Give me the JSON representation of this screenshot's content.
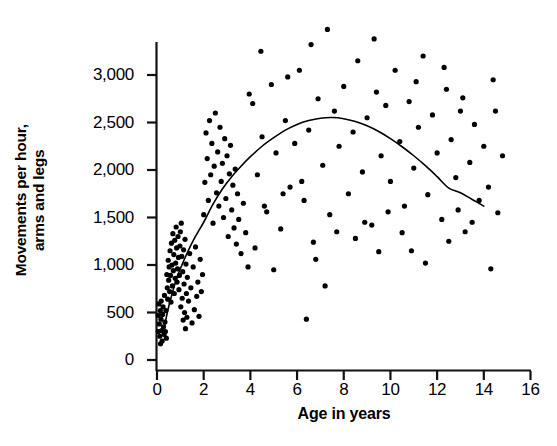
{
  "chart_data": {
    "type": "scatter",
    "title": "",
    "xlabel": "Age in years",
    "ylabel": "Movements per hour, arms and legs",
    "ylabel_lines": [
      "Movements per hour,",
      "arms and legs"
    ],
    "xlim": [
      0,
      16
    ],
    "ylim": [
      0,
      3500
    ],
    "xticks": [
      0,
      2,
      4,
      6,
      8,
      10,
      12,
      14,
      16
    ],
    "xtick_labels": [
      "0",
      "2",
      "4",
      "6",
      "8",
      "10",
      "12",
      "14",
      "16"
    ],
    "yticks": [
      0,
      500,
      1000,
      1500,
      2000,
      2500,
      3000
    ],
    "ytick_labels": [
      "0",
      "500",
      "1,000",
      "1,500",
      "2,000",
      "2,500",
      "3,000"
    ],
    "grid": false,
    "legend": null,
    "marker_color": "#000000",
    "marker_size_px": 5.2,
    "curve_color": "#000000",
    "curve_width_px": 1.6,
    "curve_description": "Quadratic trend line rising steeply from infancy, peaking near age 7.5 at about 2550 movements per hour, then declining to about 1620 by age 14",
    "series": [
      {
        "name": "Movements per hour",
        "points": [
          [
            0.05,
            470
          ],
          [
            0.06,
            300
          ],
          [
            0.08,
            590
          ],
          [
            0.1,
            380
          ],
          [
            0.12,
            250
          ],
          [
            0.14,
            520
          ],
          [
            0.15,
            170
          ],
          [
            0.17,
            430
          ],
          [
            0.18,
            620
          ],
          [
            0.2,
            310
          ],
          [
            0.22,
            200
          ],
          [
            0.24,
            480
          ],
          [
            0.26,
            560
          ],
          [
            0.28,
            350
          ],
          [
            0.3,
            270
          ],
          [
            0.32,
            680
          ],
          [
            0.34,
            400
          ],
          [
            0.36,
            300
          ],
          [
            0.38,
            520
          ],
          [
            0.4,
            230
          ],
          [
            0.42,
            900
          ],
          [
            0.44,
            760
          ],
          [
            0.46,
            640
          ],
          [
            0.48,
            1050
          ],
          [
            0.5,
            840
          ],
          [
            0.52,
            980
          ],
          [
            0.54,
            720
          ],
          [
            0.56,
            1150
          ],
          [
            0.58,
            890
          ],
          [
            0.6,
            610
          ],
          [
            0.62,
            1230
          ],
          [
            0.64,
            1000
          ],
          [
            0.66,
            780
          ],
          [
            0.68,
            1330
          ],
          [
            0.7,
            940
          ],
          [
            0.72,
            1110
          ],
          [
            0.74,
            700
          ],
          [
            0.76,
            1260
          ],
          [
            0.78,
            860
          ],
          [
            0.8,
            1020
          ],
          [
            0.82,
            1400
          ],
          [
            0.84,
            1180
          ],
          [
            0.86,
            820
          ],
          [
            0.88,
            960
          ],
          [
            0.9,
            1300
          ],
          [
            0.92,
            1080
          ],
          [
            0.94,
            740
          ],
          [
            0.96,
            890
          ],
          [
            0.98,
            1200
          ],
          [
            1.0,
            1350
          ],
          [
            1.02,
            560
          ],
          [
            1.04,
            1440
          ],
          [
            1.06,
            1090
          ],
          [
            1.08,
            650
          ],
          [
            1.1,
            930
          ],
          [
            1.12,
            420
          ],
          [
            1.14,
            1160
          ],
          [
            1.16,
            800
          ],
          [
            1.18,
            500
          ],
          [
            1.2,
            1270
          ],
          [
            1.22,
            330
          ],
          [
            1.24,
            1010
          ],
          [
            1.26,
            700
          ],
          [
            1.28,
            450
          ],
          [
            1.3,
            870
          ],
          [
            1.35,
            620
          ],
          [
            1.4,
            1120
          ],
          [
            1.45,
            760
          ],
          [
            1.5,
            390
          ],
          [
            1.55,
            980
          ],
          [
            1.6,
            530
          ],
          [
            1.65,
            1190
          ],
          [
            1.7,
            670
          ],
          [
            1.75,
            820
          ],
          [
            1.8,
            460
          ],
          [
            1.85,
            1060
          ],
          [
            1.9,
            720
          ],
          [
            1.95,
            900
          ],
          [
            2.0,
            1530
          ],
          [
            2.05,
            1870
          ],
          [
            2.1,
            2390
          ],
          [
            2.15,
            2120
          ],
          [
            2.2,
            1680
          ],
          [
            2.25,
            2520
          ],
          [
            2.3,
            1950
          ],
          [
            2.35,
            2280
          ],
          [
            2.4,
            1440
          ],
          [
            2.45,
            2040
          ],
          [
            2.5,
            2600
          ],
          [
            2.55,
            1760
          ],
          [
            2.6,
            2190
          ],
          [
            2.65,
            1620
          ],
          [
            2.7,
            2450
          ],
          [
            2.75,
            1880
          ],
          [
            2.8,
            2070
          ],
          [
            2.85,
            1500
          ],
          [
            2.9,
            2330
          ],
          [
            2.95,
            1700
          ],
          [
            3.0,
            2150
          ],
          [
            3.05,
            1300
          ],
          [
            3.1,
            1960
          ],
          [
            3.15,
            2260
          ],
          [
            3.2,
            1580
          ],
          [
            3.25,
            1840
          ],
          [
            3.3,
            1390
          ],
          [
            3.35,
            2010
          ],
          [
            3.4,
            1220
          ],
          [
            3.45,
            1750
          ],
          [
            3.5,
            1480
          ],
          [
            3.6,
            1120
          ],
          [
            3.7,
            1650
          ],
          [
            3.8,
            1340
          ],
          [
            3.9,
            980
          ],
          [
            4.1,
            2700
          ],
          [
            4.3,
            1950
          ],
          [
            4.5,
            2350
          ],
          [
            4.7,
            1560
          ],
          [
            4.9,
            2900
          ],
          [
            5.1,
            2180
          ],
          [
            5.3,
            1380
          ],
          [
            5.5,
            2520
          ],
          [
            5.7,
            1820
          ],
          [
            5.9,
            2280
          ],
          [
            6.1,
            3050
          ],
          [
            6.3,
            1680
          ],
          [
            6.5,
            2420
          ],
          [
            6.7,
            1240
          ],
          [
            6.9,
            2750
          ],
          [
            7.1,
            2050
          ],
          [
            7.3,
            3480
          ],
          [
            7.4,
            1530
          ],
          [
            7.6,
            2620
          ],
          [
            7.8,
            2250
          ],
          [
            8.0,
            2880
          ],
          [
            8.2,
            1750
          ],
          [
            8.4,
            2400
          ],
          [
            8.6,
            3150
          ],
          [
            8.8,
            1980
          ],
          [
            9.0,
            2550
          ],
          [
            9.2,
            1420
          ],
          [
            9.4,
            2820
          ],
          [
            9.6,
            2150
          ],
          [
            9.8,
            2680
          ],
          [
            10.0,
            1880
          ],
          [
            10.2,
            3050
          ],
          [
            10.4,
            2300
          ],
          [
            10.6,
            1620
          ],
          [
            10.8,
            2720
          ],
          [
            11.0,
            2020
          ],
          [
            11.2,
            2450
          ],
          [
            11.4,
            3200
          ],
          [
            11.6,
            1740
          ],
          [
            11.8,
            2580
          ],
          [
            12.0,
            2180
          ],
          [
            12.2,
            1480
          ],
          [
            12.4,
            2850
          ],
          [
            12.6,
            2320
          ],
          [
            12.8,
            1920
          ],
          [
            13.0,
            2620
          ],
          [
            13.2,
            1350
          ],
          [
            13.4,
            2080
          ],
          [
            13.6,
            2480
          ],
          [
            13.8,
            1680
          ],
          [
            14.0,
            2250
          ],
          [
            14.2,
            1820
          ],
          [
            14.4,
            2950
          ],
          [
            14.6,
            1550
          ],
          [
            14.8,
            2150
          ],
          [
            4.2,
            1180
          ],
          [
            5.0,
            950
          ],
          [
            6.4,
            430
          ],
          [
            6.8,
            1060
          ],
          [
            7.2,
            780
          ],
          [
            8.5,
            1280
          ],
          [
            9.5,
            1140
          ],
          [
            10.5,
            1340
          ],
          [
            11.5,
            1020
          ],
          [
            12.5,
            1250
          ],
          [
            13.5,
            1450
          ],
          [
            14.3,
            960
          ],
          [
            4.6,
            1620
          ],
          [
            5.4,
            1750
          ],
          [
            6.2,
            1880
          ],
          [
            7.7,
            1350
          ],
          [
            8.9,
            1450
          ],
          [
            9.9,
            1560
          ],
          [
            10.9,
            1150
          ],
          [
            12.9,
            1580
          ],
          [
            3.95,
            2800
          ],
          [
            4.45,
            3250
          ],
          [
            5.6,
            2980
          ],
          [
            6.6,
            3320
          ],
          [
            9.3,
            3380
          ],
          [
            11.1,
            2930
          ],
          [
            12.3,
            3080
          ],
          [
            13.1,
            2760
          ],
          [
            14.5,
            2620
          ]
        ]
      }
    ],
    "trend_curve": {
      "name": "fitted quadratic trend",
      "points": [
        [
          0.3,
          330
        ],
        [
          0.5,
          560
        ],
        [
          0.8,
          830
        ],
        [
          1.0,
          960
        ],
        [
          1.3,
          1130
        ],
        [
          1.6,
          1280
        ],
        [
          2.0,
          1450
        ],
        [
          2.4,
          1640
        ],
        [
          2.8,
          1800
        ],
        [
          3.2,
          1930
        ],
        [
          3.6,
          2040
        ],
        [
          4.0,
          2140
        ],
        [
          4.5,
          2250
        ],
        [
          5.0,
          2340
        ],
        [
          5.5,
          2420
        ],
        [
          6.0,
          2480
        ],
        [
          6.5,
          2520
        ],
        [
          7.0,
          2545
        ],
        [
          7.5,
          2552
        ],
        [
          8.0,
          2540
        ],
        [
          8.5,
          2510
        ],
        [
          9.0,
          2465
        ],
        [
          9.5,
          2405
        ],
        [
          10.0,
          2330
        ],
        [
          10.5,
          2245
        ],
        [
          11.0,
          2150
        ],
        [
          11.5,
          2045
        ],
        [
          12.0,
          1930
        ],
        [
          12.5,
          1810
        ],
        [
          13.0,
          1760
        ],
        [
          13.5,
          1690
        ],
        [
          14.0,
          1620
        ]
      ]
    }
  },
  "axes": {
    "x_axis_name": "x-axis",
    "y_axis_name": "y-axis"
  }
}
